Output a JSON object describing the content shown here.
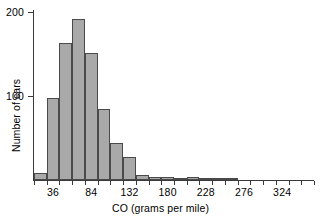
{
  "chart_data": {
    "type": "bar",
    "title": "",
    "subtitle": "",
    "xlabel": "CO (grams per mile)",
    "ylabel": "Number of cars",
    "grid": false,
    "legend": null,
    "bin_width": 16,
    "bin_edges": [
      12,
      28,
      44,
      60,
      76,
      92,
      108,
      124,
      140,
      156,
      172,
      188,
      204,
      220,
      236,
      252,
      268,
      284,
      300,
      316,
      332,
      348,
      364
    ],
    "categories": [
      "12-28",
      "28-44",
      "44-60",
      "60-76",
      "76-92",
      "92-108",
      "108-124",
      "124-140",
      "140-156",
      "156-172",
      "172-188",
      "188-204",
      "204-220",
      "220-236",
      "236-252",
      "252-268",
      "268-284",
      "284-300",
      "300-316",
      "316-332",
      "332-348",
      "348-364"
    ],
    "values": [
      8,
      98,
      163,
      192,
      151,
      84,
      44,
      27,
      6,
      4,
      4,
      1,
      3,
      1,
      1,
      1,
      0,
      0,
      0,
      0,
      0,
      0
    ],
    "xlim": [
      12,
      364
    ],
    "ylim": [
      0,
      205
    ],
    "x_tick_values": [
      36,
      84,
      132,
      180,
      228,
      276,
      324
    ],
    "x_tick_labels": [
      "36",
      "84",
      "132",
      "180",
      "228",
      "276",
      "324"
    ],
    "y_tick_values": [
      100,
      200
    ],
    "y_tick_labels": [
      "100",
      "200"
    ],
    "colors": {
      "bar_fill": "#a9a9a9",
      "bar_border": "#4a4a4a",
      "axis": "#3a3a3a",
      "text": "#000000",
      "background": "#ffffff"
    }
  }
}
